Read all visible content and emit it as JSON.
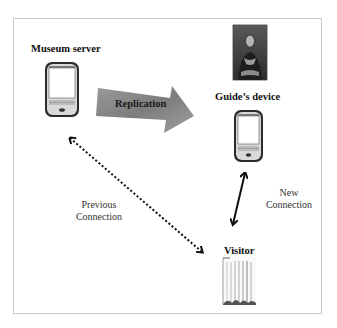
{
  "diagram": {
    "nodes": {
      "museum_server": {
        "label": "Museum server",
        "icon": "smartphone-icon"
      },
      "guide_device": {
        "label": "Guide’s device",
        "icon": "smartphone-icon"
      },
      "painting": {
        "icon": "mona-lisa-painting-icon"
      },
      "visitor": {
        "label": "Visitor",
        "icon": "visitor-figure-icon"
      }
    },
    "edges": {
      "replication": {
        "label": "Replication",
        "from": "Museum server",
        "to": "Guide’s device",
        "style": "thick-block-arrow"
      },
      "previous_connection": {
        "line1": "Previous",
        "line2": "Connection",
        "from": "Visitor",
        "to": "Museum server",
        "style": "dotted-bidirectional"
      },
      "new_connection": {
        "line1": "New",
        "line2": "Connection",
        "from": "Visitor",
        "to": "Guide’s device",
        "style": "solid-bidirectional"
      }
    },
    "colors": {
      "border": "#c8c8c8",
      "arrow_fill": "#8a8a8a",
      "text": "#111111"
    }
  }
}
